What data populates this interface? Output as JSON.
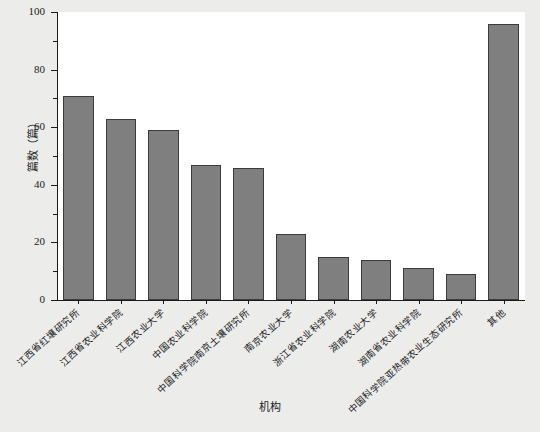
{
  "chart_data": {
    "type": "bar",
    "title": "",
    "xlabel": "机构",
    "ylabel": "篇数（篇）",
    "ylim": [
      0,
      100
    ],
    "yticks": [
      0,
      20,
      40,
      60,
      80,
      100
    ],
    "ytick_labels": [
      "0",
      "20",
      "40",
      "60",
      "80",
      "100"
    ],
    "yminor_step": 10,
    "grid": false,
    "legend": null,
    "bar_color": "#7f7f7f",
    "bar_edge_color": "#3c3c3c",
    "background_color": "#ececeb",
    "plot_background_color": "#ffffff",
    "categories": [
      "江西省红壤研究所",
      "江西省农业科学院",
      "江西农业大学",
      "中国农业科学院",
      "中国科学院南京土壤研究所",
      "南京农业大学",
      "浙江省农业科学院",
      "湖南农业大学",
      "湖南省农业科学院",
      "中国科学院亚热带农业生态研究所",
      "其他"
    ],
    "values": [
      71,
      63,
      59,
      47,
      46,
      23,
      15,
      14,
      11,
      9,
      96
    ]
  }
}
